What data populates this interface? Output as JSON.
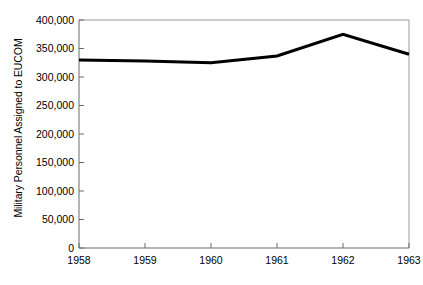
{
  "chart_data": {
    "type": "line",
    "title": "",
    "xlabel": "",
    "ylabel": "Military Personnel Assigned to EUCOM",
    "categories": [
      "1958",
      "1959",
      "1960",
      "1961",
      "1962",
      "1963"
    ],
    "x": [
      1958,
      1959,
      1960,
      1961,
      1962,
      1963
    ],
    "values": [
      330000,
      328000,
      325000,
      337000,
      375000,
      340000
    ],
    "series": [
      {
        "name": "Military Personnel Assigned to EUCOM",
        "values": [
          330000,
          328000,
          325000,
          337000,
          375000,
          340000
        ]
      }
    ],
    "ylim": [
      0,
      400000
    ],
    "xlim": [
      1958,
      1963
    ],
    "y_ticks": [
      0,
      50000,
      100000,
      150000,
      200000,
      250000,
      300000,
      350000,
      400000
    ],
    "y_tick_labels": [
      "0",
      "50,000",
      "100,000",
      "150,000",
      "200,000",
      "250,000",
      "300,000",
      "350,000",
      "400,000"
    ],
    "x_ticks": [
      1958,
      1959,
      1960,
      1961,
      1962,
      1963
    ],
    "x_tick_labels": [
      "1958",
      "1959",
      "1960",
      "1961",
      "1962",
      "1963"
    ],
    "grid": false,
    "legend": false,
    "legend_position": "none",
    "line_color": "#000000",
    "axis_color": "#808080",
    "background_color": "#ffffff"
  },
  "axis": {
    "y_title": "Military Personnel Assigned to EUCOM",
    "labels": {
      "y0": "0",
      "y1": "50,000",
      "y2": "100,000",
      "y3": "150,000",
      "y4": "200,000",
      "y5": "250,000",
      "y6": "300,000",
      "y7": "350,000",
      "y8": "400,000",
      "x0": "1958",
      "x1": "1959",
      "x2": "1960",
      "x3": "1961",
      "x4": "1962",
      "x5": "1963"
    }
  }
}
